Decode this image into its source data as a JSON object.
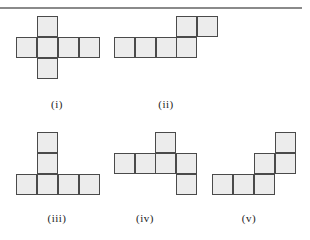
{
  "colors": {
    "fill": "#ececec",
    "stroke": "#4a4a4a",
    "rule": "#8a8a8a"
  },
  "cell_size": 21,
  "nets": [
    {
      "id": "i",
      "label": "(i)",
      "label_x": 57,
      "label_y": 98,
      "cells": [
        [
          37,
          16
        ],
        [
          16,
          37
        ],
        [
          37,
          37
        ],
        [
          58,
          37
        ],
        [
          79,
          37
        ],
        [
          37,
          58
        ]
      ]
    },
    {
      "id": "ii",
      "label": "(ii)",
      "label_x": 166,
      "label_y": 98,
      "cells": [
        [
          176,
          16
        ],
        [
          197,
          16
        ],
        [
          114,
          37
        ],
        [
          135,
          37
        ],
        [
          156,
          37
        ],
        [
          176,
          37
        ]
      ]
    },
    {
      "id": "iii",
      "label": "(iii)",
      "label_x": 57,
      "label_y": 212,
      "cells": [
        [
          37,
          132
        ],
        [
          37,
          153
        ],
        [
          16,
          174
        ],
        [
          37,
          174
        ],
        [
          58,
          174
        ],
        [
          79,
          174
        ]
      ]
    },
    {
      "id": "iv",
      "label": "(iv)",
      "label_x": 145,
      "label_y": 212,
      "cells": [
        [
          155,
          132
        ],
        [
          114,
          153
        ],
        [
          135,
          153
        ],
        [
          155,
          153
        ],
        [
          176,
          153
        ],
        [
          176,
          174
        ]
      ]
    },
    {
      "id": "v",
      "label": "(v)",
      "label_x": 249,
      "label_y": 212,
      "cells": [
        [
          275,
          132
        ],
        [
          254,
          153
        ],
        [
          275,
          153
        ],
        [
          212,
          174
        ],
        [
          233,
          174
        ],
        [
          254,
          174
        ]
      ]
    }
  ]
}
